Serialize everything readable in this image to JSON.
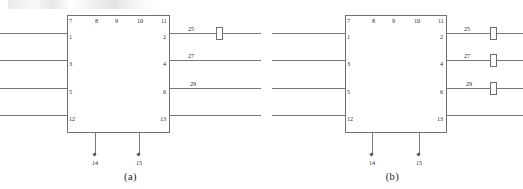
{
  "figure": {
    "device_label": "RQ (JJR2000)",
    "diagrams": [
      {
        "id": "a",
        "caption": "(a)",
        "top_pins": [
          "7",
          "8",
          "9",
          "10",
          "11"
        ],
        "left_pins": [
          "1",
          "3",
          "5",
          "12"
        ],
        "right_pins": [
          "2",
          "4",
          "6",
          "13"
        ],
        "bottom_pins": [
          "14",
          "15"
        ],
        "wire_numbers": [
          "25",
          "27",
          "29"
        ],
        "component_count": 1,
        "components_on_wires": [
          "25"
        ]
      },
      {
        "id": "b",
        "caption": "(b)",
        "top_pins": [
          "7",
          "8",
          "9",
          "10",
          "11"
        ],
        "left_pins": [
          "1",
          "3",
          "5",
          "12"
        ],
        "right_pins": [
          "2",
          "4",
          "6",
          "13"
        ],
        "bottom_pins": [
          "14",
          "15"
        ],
        "wire_numbers": [
          "25",
          "27",
          "29"
        ],
        "component_count": 3,
        "components_on_wires": [
          "25",
          "27",
          "29"
        ]
      }
    ]
  },
  "colors": {
    "line": "#77777b",
    "box_border": "#6e6e72",
    "text": "#1a1a1a",
    "background": "#ffffff"
  }
}
